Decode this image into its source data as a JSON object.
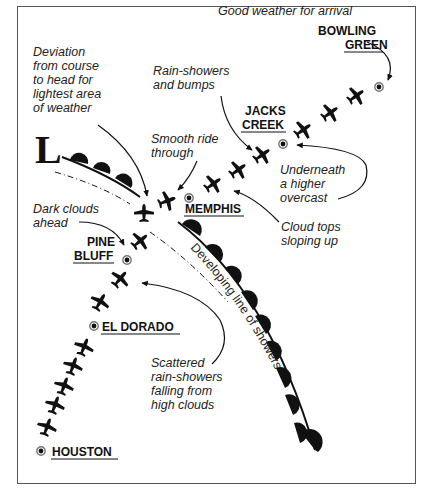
{
  "diagram": {
    "low_pressure_label": "L",
    "cities": [
      {
        "name": "BOWLING GREEN",
        "line1": "BOWLING",
        "line2": "GREEN"
      },
      {
        "name": "JACKS CREEK",
        "line1": "JACKS",
        "line2": "CREEK"
      },
      {
        "name": "MEMPHIS",
        "line1": "MEMPHIS"
      },
      {
        "name": "PINE BLUFF",
        "line1": "PINE",
        "line2": "BLUFF"
      },
      {
        "name": "EL DORADO",
        "line1": "EL DORADO"
      },
      {
        "name": "HOUSTON",
        "line1": "HOUSTON"
      }
    ],
    "annotations": [
      {
        "id": "good-weather",
        "lines": [
          "Good weather for arrival"
        ]
      },
      {
        "id": "deviation",
        "lines": [
          "Deviation",
          "from course",
          "to head for",
          "lightest area",
          "of weather"
        ]
      },
      {
        "id": "rain-bumps",
        "lines": [
          "Rain-showers",
          "and bumps"
        ]
      },
      {
        "id": "smooth-ride",
        "lines": [
          "Smooth ride",
          "through"
        ]
      },
      {
        "id": "underneath",
        "lines": [
          "Underneath",
          "a higher",
          "overcast"
        ]
      },
      {
        "id": "dark-clouds",
        "lines": [
          "Dark clouds",
          "ahead"
        ]
      },
      {
        "id": "cloud-tops",
        "lines": [
          "Cloud tops",
          "sloping up"
        ]
      },
      {
        "id": "scattered",
        "lines": [
          "Scattered",
          "rain-showers",
          "falling from",
          "high clouds"
        ]
      }
    ],
    "front_label": "Developing line of showers",
    "colors": {
      "ink": "#111111",
      "text": "#222222",
      "background": "#ffffff"
    }
  }
}
